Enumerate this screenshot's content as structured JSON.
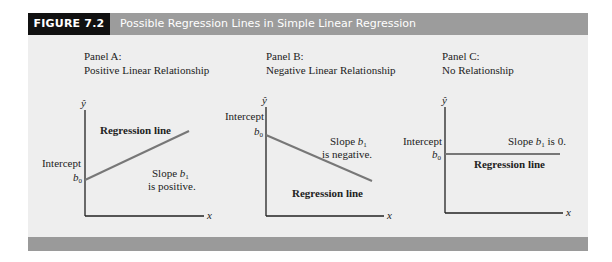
{
  "figure": {
    "label": "FIGURE 7.2",
    "title": "Possible Regression Lines in Simple Linear Regression",
    "colors": {
      "label_bg": "#111111",
      "header_bg": "#9c9c9c",
      "body_bg": "#eeeeee",
      "footer_bg": "#9a9a9a",
      "line": "#777777",
      "axis": "#222222"
    }
  },
  "panels": [
    {
      "name": "Panel A:",
      "subtitle": "Positive Linear Relationship",
      "y_axis_label": "ŷ",
      "x_axis_label": "x",
      "intercept_label": "Intercept",
      "b0_label": "b",
      "b0_sub": "0",
      "line_label": "Regression line",
      "slope_line1_pre": "Slope ",
      "slope_b": "b",
      "slope_sub": "1",
      "slope_line2": "is positive."
    },
    {
      "name": "Panel B:",
      "subtitle": "Negative Linear Relationship",
      "y_axis_label": "ŷ",
      "x_axis_label": "x",
      "intercept_label": "Intercept",
      "b0_label": "b",
      "b0_sub": "0",
      "line_label": "Regression line",
      "slope_line1_pre": "Slope ",
      "slope_b": "b",
      "slope_sub": "1",
      "slope_line2": "is negative."
    },
    {
      "name": "Panel C:",
      "subtitle": "No Relationship",
      "y_axis_label": "ŷ",
      "x_axis_label": "x",
      "intercept_label": "Intercept",
      "b0_label": "b",
      "b0_sub": "0",
      "line_label": "Regression line",
      "slope_line1_pre": "Slope ",
      "slope_b": "b",
      "slope_sub": "1",
      "slope_suffix": " is 0."
    }
  ]
}
